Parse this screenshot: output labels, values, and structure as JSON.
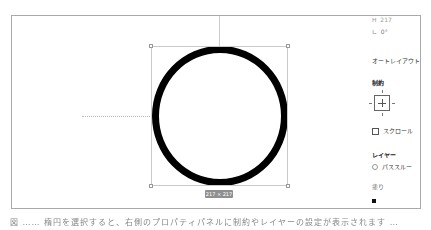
{
  "canvas": {
    "shape": "ellipse",
    "stroke_color": "#000000",
    "fill_color": "#ffffff",
    "size_label": "217 × 217"
  },
  "panel": {
    "height_label": "H",
    "height_value": "217",
    "rotation_label": "∟",
    "rotation_value": "0°",
    "auto_layout": "オートレイアウト",
    "constraints_heading": "制約",
    "scroll_checkbox": "スクロール",
    "layer_heading": "レイヤー",
    "blend_mode": "パススルー",
    "fill_heading": "塗り",
    "fill_color": "#000000"
  },
  "caption": "図 …… 楕円を選択すると、右側のプロパティパネルに制約やレイヤーの設定が表示されます …"
}
